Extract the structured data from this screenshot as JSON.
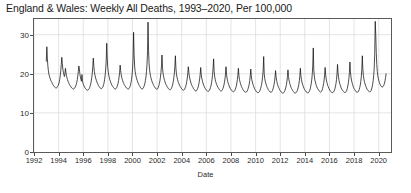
{
  "chart_data": {
    "type": "line",
    "title": "England & Wales: Weekly All Deaths, 1993–2020, Per 100,000",
    "xlabel": "Date",
    "ylabel": "",
    "xlim": [
      1992.0,
      2021.0
    ],
    "ylim": [
      0,
      34
    ],
    "grid": true,
    "legend": false,
    "yticks": [
      0,
      10,
      20,
      30
    ],
    "ytick_labels": [
      "0",
      "10",
      "20",
      "30"
    ],
    "xticks": [
      1992,
      1994,
      1996,
      1998,
      2000,
      2002,
      2004,
      2006,
      2008,
      2010,
      2012,
      2014,
      2016,
      2018,
      2020
    ],
    "xtick_labels": [
      "1992",
      "1994",
      "1996",
      "1998",
      "2000",
      "2002",
      "2004",
      "2006",
      "2008",
      "2010",
      "2012",
      "2014",
      "2016",
      "2018",
      "2020"
    ],
    "line_color": "#111111",
    "grid_color": "#d8d8d8",
    "series": [
      {
        "name": "Weekly all deaths per 100,000",
        "x_start": 1993.0,
        "x_end": 2020.6,
        "n_points": 1440,
        "description": "Weekly all-cause mortality rate, strong winter seasonality, declining baseline, exceptional April 2020 COVID-19 peak",
        "values": [
          23.2,
          26.9,
          24.0,
          22.0,
          20.8,
          19.9,
          19.4,
          19.0,
          18.6,
          18.2,
          18.0,
          17.7,
          17.4,
          17.2,
          17.0,
          16.8,
          16.6,
          16.5,
          16.4,
          16.3,
          16.4,
          16.6,
          16.8,
          17.0,
          17.4,
          17.9,
          18.6,
          19.5,
          20.8,
          22.4,
          24.2,
          22.6,
          21.2,
          20.4,
          19.8,
          19.3,
          19.9,
          21.4,
          20.4,
          19.5,
          19.0,
          18.5,
          18.1,
          17.8,
          17.5,
          17.2,
          17.0,
          16.8,
          16.6,
          16.4,
          16.3,
          16.2,
          16.1,
          16.1,
          16.2,
          16.4,
          16.6,
          16.9,
          17.3,
          17.8,
          18.5,
          19.4,
          20.6,
          22.0,
          21.2,
          20.0,
          19.2,
          18.6,
          18.1,
          19.8,
          18.2,
          17.6,
          17.2,
          16.9,
          16.6,
          16.4,
          16.2,
          16.0,
          15.9,
          15.8,
          15.8,
          15.9,
          16.0,
          16.2,
          16.5,
          16.9,
          17.4,
          18.1,
          19.0,
          20.2,
          21.8,
          24.0,
          22.0,
          20.6,
          19.8,
          19.2,
          18.7,
          18.3,
          17.9,
          17.6,
          17.3,
          17.0,
          16.8,
          16.6,
          16.4,
          16.3,
          16.2,
          16.2,
          16.3,
          16.5,
          16.8,
          17.2,
          17.8,
          18.6,
          19.7,
          21.2,
          23.4,
          27.8,
          24.0,
          21.6,
          20.4,
          19.6,
          19.0,
          18.5,
          18.1,
          17.7,
          17.4,
          17.1,
          16.9,
          16.7,
          16.5,
          16.3,
          16.2,
          16.1,
          16.1,
          16.2,
          16.4,
          16.7,
          17.1,
          17.6,
          18.3,
          19.2,
          20.4,
          22.2,
          20.8,
          19.8,
          19.1,
          18.6,
          18.2,
          17.8,
          17.5,
          17.2,
          17.0,
          16.8,
          16.6,
          16.4,
          16.3,
          16.2,
          16.1,
          16.1,
          16.2,
          16.4,
          16.7,
          17.1,
          17.7,
          18.5,
          19.6,
          21.2,
          23.8,
          30.6,
          25.0,
          22.0,
          20.6,
          19.8,
          19.2,
          18.7,
          18.3,
          17.9,
          17.6,
          17.3,
          17.0,
          16.8,
          16.6,
          16.4,
          16.2,
          16.1,
          16.1,
          16.2,
          16.4,
          16.7,
          17.1,
          17.6,
          18.3,
          19.2,
          20.5,
          22.4,
          25.6,
          33.2,
          26.0,
          22.6,
          21.0,
          20.0,
          19.3,
          18.8,
          18.3,
          17.9,
          17.6,
          17.3,
          17.0,
          16.8,
          16.6,
          16.4,
          16.2,
          16.1,
          16.0,
          16.1,
          16.3,
          16.6,
          17.0,
          17.5,
          18.2,
          19.1,
          20.3,
          22.0,
          24.8,
          21.6,
          20.2,
          19.4,
          18.8,
          18.3,
          17.9,
          17.5,
          17.2,
          17.0,
          16.7,
          16.5,
          16.3,
          16.1,
          16.0,
          15.9,
          15.9,
          16.0,
          16.2,
          16.5,
          16.9,
          17.4,
          18.1,
          19.0,
          20.2,
          21.9,
          24.6,
          21.4,
          20.0,
          19.2,
          18.6,
          18.1,
          17.7,
          17.4,
          17.1,
          16.8,
          16.6,
          16.4,
          16.2,
          16.0,
          15.9,
          15.8,
          15.8,
          15.9,
          16.1,
          16.4,
          16.8,
          17.3,
          18.0,
          18.9,
          20.1,
          21.8,
          20.4,
          19.4,
          18.7,
          18.2,
          17.7,
          17.3,
          17.0,
          16.7,
          16.5,
          16.2,
          16.0,
          15.9,
          15.7,
          15.6,
          15.6,
          15.7,
          15.9,
          16.2,
          16.6,
          17.1,
          17.8,
          18.7,
          19.9,
          21.6,
          19.8,
          18.9,
          18.3,
          17.8,
          17.4,
          17.0,
          16.7,
          16.4,
          16.2,
          16.0,
          15.8,
          15.7,
          15.6,
          15.5,
          15.5,
          15.6,
          15.8,
          16.1,
          16.5,
          17.0,
          17.7,
          18.6,
          19.8,
          21.4,
          23.8,
          20.6,
          19.4,
          18.6,
          18.0,
          17.6,
          17.2,
          16.9,
          16.6,
          16.4,
          16.2,
          16.0,
          15.8,
          15.7,
          15.6,
          15.6,
          15.7,
          15.9,
          16.2,
          16.6,
          17.1,
          17.8,
          18.7,
          19.9,
          21.8,
          19.9,
          18.9,
          18.2,
          17.7,
          17.3,
          16.9,
          16.6,
          16.3,
          16.1,
          15.9,
          15.7,
          15.6,
          15.5,
          15.4,
          15.4,
          15.5,
          15.7,
          16.0,
          16.4,
          16.9,
          17.6,
          18.5,
          19.7,
          21.4,
          19.6,
          18.6,
          18.0,
          17.5,
          17.1,
          16.7,
          16.4,
          16.2,
          15.9,
          15.7,
          15.6,
          15.4,
          15.3,
          15.3,
          15.3,
          15.4,
          15.6,
          15.9,
          16.3,
          16.8,
          17.4,
          18.3,
          19.5,
          21.2,
          19.4,
          18.5,
          17.9,
          17.4,
          17.0,
          16.6,
          16.3,
          16.0,
          15.8,
          15.6,
          15.4,
          15.3,
          15.2,
          15.2,
          15.2,
          15.3,
          15.5,
          15.8,
          16.2,
          16.7,
          17.3,
          18.2,
          19.4,
          21.0,
          24.4,
          20.0,
          18.8,
          18.1,
          17.6,
          17.1,
          16.8,
          16.4,
          16.2,
          15.9,
          15.7,
          15.6,
          15.4,
          15.3,
          15.3,
          15.3,
          15.5,
          15.7,
          16.1,
          16.6,
          17.2,
          18.0,
          19.2,
          20.8,
          19.2,
          18.3,
          17.7,
          17.2,
          16.8,
          16.5,
          16.2,
          15.9,
          15.7,
          15.5,
          15.3,
          15.2,
          15.1,
          15.1,
          15.1,
          15.2,
          15.4,
          15.7,
          16.1,
          16.6,
          17.2,
          18.1,
          19.3,
          21.0,
          19.3,
          18.4,
          17.8,
          17.3,
          16.9,
          16.5,
          16.2,
          16.0,
          15.7,
          15.5,
          15.4,
          15.2,
          15.1,
          15.1,
          15.1,
          15.2,
          15.4,
          15.7,
          16.1,
          16.6,
          17.3,
          18.2,
          19.4,
          21.4,
          19.5,
          18.6,
          17.9,
          17.4,
          17.0,
          16.6,
          16.3,
          16.0,
          15.8,
          15.6,
          15.4,
          15.3,
          15.2,
          15.1,
          15.1,
          15.2,
          15.4,
          15.7,
          16.1,
          16.7,
          17.4,
          18.4,
          19.8,
          22.0,
          26.6,
          21.0,
          19.4,
          18.5,
          17.9,
          17.4,
          17.0,
          16.6,
          16.3,
          16.1,
          15.9,
          15.7,
          15.5,
          15.4,
          15.3,
          15.4,
          15.5,
          15.8,
          16.2,
          16.8,
          17.5,
          18.4,
          19.8,
          21.6,
          19.7,
          18.7,
          18.0,
          17.5,
          17.0,
          16.7,
          16.3,
          16.1,
          15.8,
          15.6,
          15.5,
          15.3,
          15.2,
          15.2,
          15.2,
          15.3,
          15.5,
          15.8,
          16.2,
          16.8,
          17.5,
          18.5,
          20.0,
          22.4,
          20.2,
          19.0,
          18.2,
          17.6,
          17.2,
          16.8,
          16.4,
          16.1,
          15.9,
          15.7,
          15.5,
          15.4,
          15.3,
          15.2,
          15.2,
          15.3,
          15.5,
          15.8,
          16.3,
          16.9,
          17.7,
          18.8,
          20.4,
          23.0,
          20.5,
          19.2,
          18.4,
          17.8,
          17.3,
          16.9,
          16.5,
          16.2,
          16.0,
          15.8,
          15.6,
          15.4,
          15.3,
          15.3,
          15.3,
          15.4,
          15.6,
          16.0,
          16.5,
          17.1,
          18.0,
          19.2,
          21.0,
          24.6,
          21.2,
          19.6,
          18.7,
          18.0,
          17.5,
          17.1,
          16.7,
          16.4,
          16.1,
          15.9,
          15.7,
          15.6,
          15.5,
          15.4,
          15.4,
          15.5,
          15.7,
          16.1,
          16.6,
          17.3,
          18.2,
          19.5,
          21.4,
          25.2,
          33.4,
          30.0,
          25.4,
          22.4,
          20.6,
          19.5,
          18.8,
          18.2,
          17.8,
          17.4,
          17.1,
          16.9,
          16.7,
          16.6,
          16.6,
          16.7,
          16.9,
          17.2,
          17.6,
          18.2,
          19.0,
          20.0
        ]
      }
    ],
    "annotations": [
      {
        "label": "1996 winter peak",
        "x": 1996.1,
        "y": 27.8
      },
      {
        "label": "1999/2000 flu peak",
        "x": 2000.0,
        "y": 33.2
      },
      {
        "label": "1999 flu peak",
        "x": 1999.0,
        "y": 30.6
      },
      {
        "label": "April 2020 COVID-19 peak",
        "x": 2020.3,
        "y": 33.4
      }
    ]
  }
}
